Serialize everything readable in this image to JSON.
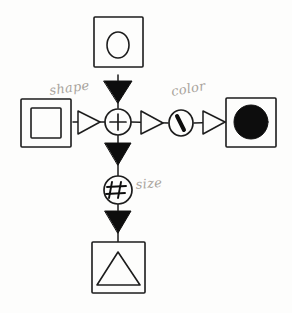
{
  "diagram": {
    "medium": "pencil and ink on paper",
    "background_color": "#fdfdfc",
    "ink_color": "#1d1d1d",
    "pencil_color": "#a9a49d",
    "nodes": [
      {
        "id": "top-source",
        "data_name": "node-box-circle",
        "kind": "box",
        "glyph": "circle-outline",
        "fill": "none",
        "label": "",
        "position": "top",
        "cx": 118,
        "cy": 46
      },
      {
        "id": "left-source",
        "data_name": "node-box-square",
        "kind": "box",
        "glyph": "square-outline",
        "fill": "none",
        "label": "",
        "position": "left",
        "cx": 44,
        "cy": 122
      },
      {
        "id": "center-op",
        "data_name": "node-circle-plus",
        "kind": "circle-operator",
        "glyph": "+",
        "fill": "none",
        "label": "",
        "position": "center",
        "cx": 118,
        "cy": 122
      },
      {
        "id": "mid-right-op",
        "data_name": "node-circle-slash",
        "kind": "circle-operator",
        "glyph": "\\",
        "fill": "none",
        "label": "",
        "position": "right-arm",
        "cx": 181,
        "cy": 123
      },
      {
        "id": "right-sink",
        "data_name": "node-box-filled-circle",
        "kind": "box",
        "glyph": "circle-filled",
        "fill": "#101010",
        "label": "",
        "position": "right",
        "cx": 250,
        "cy": 122
      },
      {
        "id": "bottom-op",
        "data_name": "node-circle-hash",
        "kind": "circle-operator",
        "glyph": "#",
        "fill": "none",
        "label": "",
        "position": "below-center",
        "cx": 118,
        "cy": 190
      },
      {
        "id": "bottom-sink",
        "data_name": "node-box-triangle",
        "kind": "box",
        "glyph": "triangle-outline",
        "fill": "none",
        "label": "",
        "position": "bottom",
        "cx": 118,
        "cy": 267
      }
    ],
    "edges": [
      {
        "id": "e-top-center",
        "data_name": "edge-top-to-center",
        "from": "top-source",
        "to": "center-op",
        "arrowhead": "solid-triangle",
        "direction": "down",
        "label": ""
      },
      {
        "id": "e-left-center",
        "data_name": "edge-left-to-center",
        "from": "left-source",
        "to": "center-op",
        "arrowhead": "hollow-triangle",
        "direction": "right",
        "label": "shape"
      },
      {
        "id": "e-center-slash",
        "data_name": "edge-center-to-slash",
        "from": "center-op",
        "to": "mid-right-op",
        "arrowhead": "hollow-triangle",
        "direction": "right",
        "label": "color"
      },
      {
        "id": "e-slash-right",
        "data_name": "edge-slash-to-right",
        "from": "mid-right-op",
        "to": "right-sink",
        "arrowhead": "hollow-triangle",
        "direction": "right",
        "label": ""
      },
      {
        "id": "e-center-hash",
        "data_name": "edge-center-to-hash",
        "from": "center-op",
        "to": "bottom-op",
        "arrowhead": "solid-triangle",
        "direction": "down",
        "label": "size"
      },
      {
        "id": "e-hash-bottom",
        "data_name": "edge-hash-to-bottom",
        "from": "bottom-op",
        "to": "bottom-sink",
        "arrowhead": "solid-triangle",
        "direction": "down",
        "label": ""
      }
    ],
    "annotations": [
      {
        "id": "a-shape",
        "data_name": "annotation-shape",
        "text": "shape",
        "x": 50,
        "y": 95,
        "rotate": -8
      },
      {
        "id": "a-color",
        "data_name": "annotation-color",
        "text": "color",
        "x": 172,
        "y": 96,
        "rotate": -10
      },
      {
        "id": "a-size",
        "data_name": "annotation-size",
        "text": "size",
        "x": 136,
        "y": 189,
        "rotate": -5
      }
    ],
    "operator_glyphs": {
      "plus": "+",
      "hash": "#",
      "slash": "\\"
    }
  }
}
